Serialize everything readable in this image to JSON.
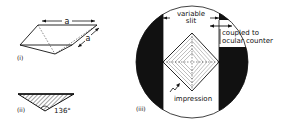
{
  "figure": {
    "panel_i": {
      "label": "(i)",
      "dimension_top": "a",
      "dimension_side": "a"
    },
    "panel_ii": {
      "label": "(ii)",
      "angle": "136°"
    },
    "panel_iii": {
      "label": "(iii)",
      "slit_label_line1": "variable",
      "slit_label_line2": "slit",
      "counter_label_line1": "coupled to",
      "counter_label_line2": "ocular counter",
      "impression_label": "impression"
    }
  },
  "colors": {
    "ink": "#111111",
    "background": "#ffffff"
  }
}
